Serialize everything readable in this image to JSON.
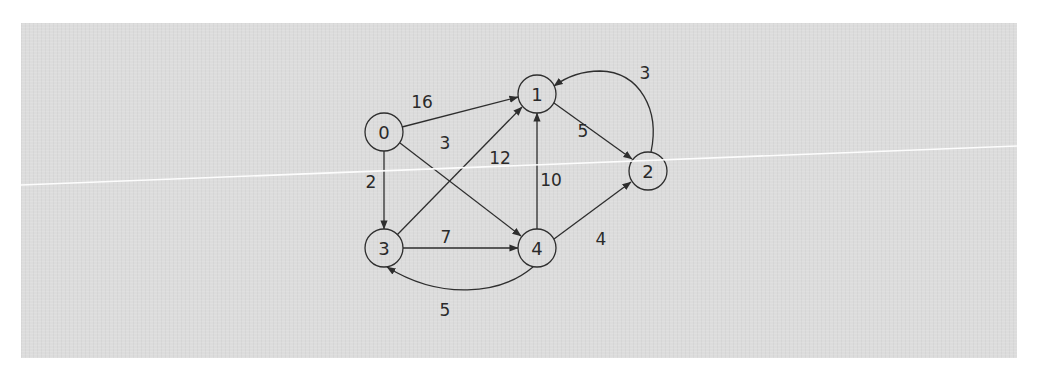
{
  "diagram": {
    "type": "directed-weighted-graph",
    "background_color": "#dcdcdc",
    "line_color": "#2e2e2e",
    "nodes": [
      {
        "id": "0",
        "label": "0",
        "x": 384,
        "y": 132
      },
      {
        "id": "1",
        "label": "1",
        "x": 537,
        "y": 94
      },
      {
        "id": "2",
        "label": "2",
        "x": 648,
        "y": 171
      },
      {
        "id": "3",
        "label": "3",
        "x": 384,
        "y": 248
      },
      {
        "id": "4",
        "label": "4",
        "x": 537,
        "y": 248
      }
    ],
    "edges": [
      {
        "from": "0",
        "to": "1",
        "weight": "16"
      },
      {
        "from": "0",
        "to": "4",
        "weight": "3"
      },
      {
        "from": "0",
        "to": "3",
        "weight": "2"
      },
      {
        "from": "3",
        "to": "1",
        "weight": "12"
      },
      {
        "from": "3",
        "to": "4",
        "weight": "7"
      },
      {
        "from": "4",
        "to": "1",
        "weight": "10"
      },
      {
        "from": "1",
        "to": "2",
        "weight": "5"
      },
      {
        "from": "2",
        "to": "1",
        "weight": "3"
      },
      {
        "from": "4",
        "to": "2",
        "weight": "4"
      },
      {
        "from": "4",
        "to": "3",
        "weight": "5"
      }
    ]
  }
}
